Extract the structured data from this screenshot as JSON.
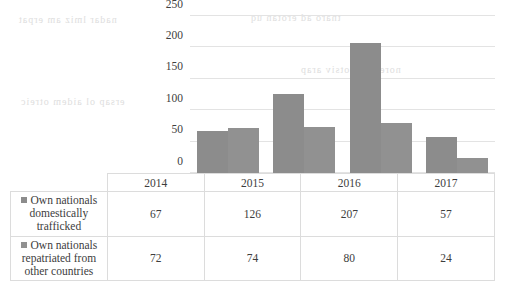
{
  "chart_data": {
    "type": "bar",
    "title": "",
    "xlabel": "",
    "ylabel": "",
    "categories": [
      "2014",
      "2015",
      "2016",
      "2017"
    ],
    "series": [
      {
        "name": "Own nationals domestically trafficked",
        "values": [
          67,
          126,
          207,
          57
        ],
        "color": "#8c8c8c"
      },
      {
        "name": "Own nationals repatriated from other countries",
        "values": [
          72,
          74,
          80,
          24
        ],
        "color": "#919191"
      }
    ],
    "ylim": [
      0,
      250
    ],
    "yticks": [
      "0",
      "50",
      "100",
      "150",
      "200",
      "250"
    ],
    "grid": true,
    "legend_position": "bottom-table"
  },
  "table": {
    "year_headers": [
      "2014",
      "2015",
      "2016",
      "2017"
    ],
    "rows": [
      {
        "label_line1": "Own nationals domestically",
        "label_line2": "trafficked",
        "values": [
          "67",
          "126",
          "207",
          "57"
        ]
      },
      {
        "label_line1": "Own nationals repatriated from",
        "label_line2": "other countries",
        "values": [
          "72",
          "74",
          "80",
          "24"
        ]
      }
    ]
  },
  "ghost_text": {
    "a": "nadar  lmiz  am  erpat",
    "b": "tnaro  ad  erotan  uq",
    "c": "ersap  ol   aidem  otreic",
    "d": "norem  sal  otsiv  arap"
  }
}
